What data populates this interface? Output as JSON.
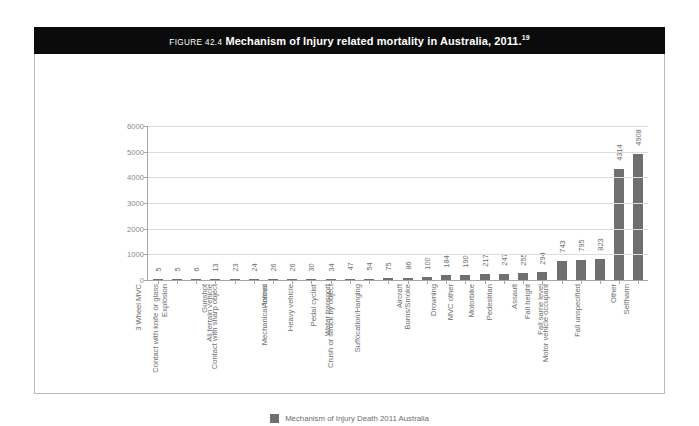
{
  "figure": {
    "number_label": "FIGURE 42.4",
    "title": "Mechanism of Injury related mortality in Australia, 2011.",
    "superscript": "19"
  },
  "legend": {
    "label": "Mechanism of Injury Death 2011 Australia",
    "swatch_color": "#706f6f"
  },
  "colors": {
    "bar": "#706f6f",
    "axis": "#a6a6a6",
    "grid": "#dcdcdc",
    "banner": "#0c0b0b",
    "label_text": "#6f6f6f",
    "frame_border": "#b9b9b9"
  },
  "chart_data": {
    "type": "bar",
    "title": "Mechanism of Injury related mortality in Australia, 2011.",
    "xlabel": "",
    "ylabel": "",
    "ylim": [
      0,
      6000
    ],
    "yticks": [
      0,
      1000,
      2000,
      3000,
      4000,
      5000,
      6000
    ],
    "ytick_labels": [
      "0",
      "1000",
      "2000",
      "3000",
      "4000",
      "5000",
      "6000"
    ],
    "grid": true,
    "legend_position": "bottom-center",
    "series_name": "Mechanism of Injury Death 2011 Australia",
    "categories": [
      "3 Wheel MVC",
      "Explosion",
      "Contact with knife or glass",
      "Gunshot",
      "All terrain vehicle",
      "Contact with sharp object",
      "Animal",
      "Mechanical forces",
      "Heavy vehicle",
      "Pedal cyclist",
      "Water transport",
      "Crush or struck by object",
      "Suffocation/Hanging",
      "Aircraft",
      "Burns/Smoke",
      "Drowning",
      "MVC other",
      "Motorbike",
      "Pedestrian",
      "Assault",
      "Fall height",
      "Fall same level",
      "Motor vehicle occupant",
      "Fall unspecified",
      "Other",
      "Selfharm"
    ],
    "values": [
      5,
      5,
      6,
      13,
      23,
      24,
      26,
      26,
      30,
      34,
      47,
      54,
      75,
      86,
      100,
      184,
      190,
      217,
      247,
      255,
      294,
      743,
      795,
      823,
      4314,
      4908
    ],
    "value_labels": [
      "5",
      "5",
      "6",
      "13",
      "23",
      "24",
      "26",
      "26",
      "30",
      "34",
      "47",
      "54",
      "75",
      "86",
      "100",
      "184",
      "190",
      "217",
      "247",
      "255",
      "294",
      "743",
      "795",
      "823",
      "4314",
      "4908"
    ]
  }
}
